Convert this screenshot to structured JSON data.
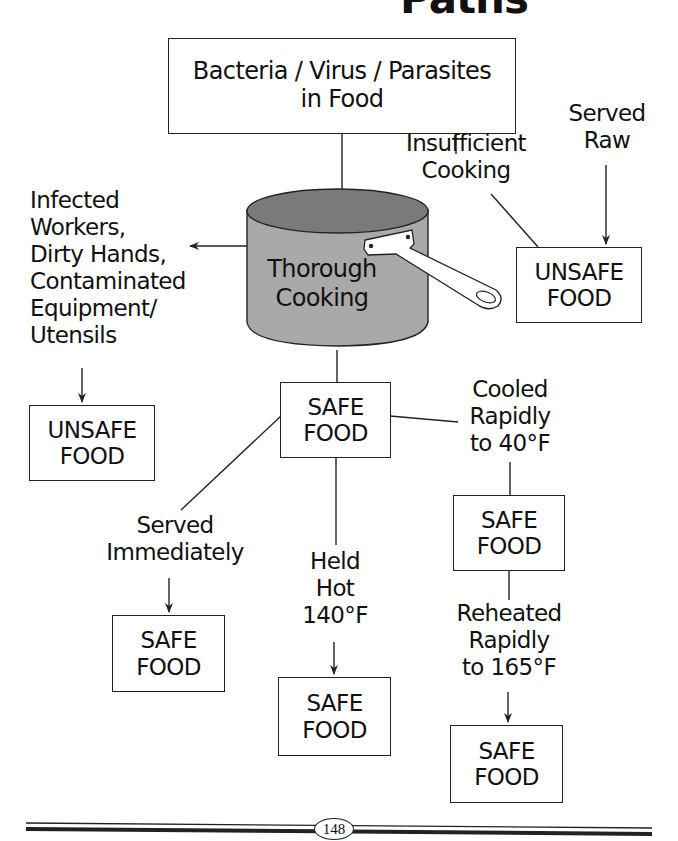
{
  "page": {
    "title_fragment": "Paths",
    "page_number": "148"
  },
  "nodes": {
    "source": {
      "lines": [
        "Bacteria / Virus / Parasites",
        "in Food"
      ]
    },
    "cooking": {
      "lines": [
        "Thorough",
        "Cooking"
      ],
      "icon": "cooking-pot-icon"
    },
    "contamination_cause": {
      "lines": [
        "Infected",
        "Workers,",
        "Dirty Hands,",
        "Contaminated",
        "Equipment/",
        "Utensils"
      ]
    },
    "unsafe_left": {
      "lines": [
        "UNSAFE",
        "FOOD"
      ]
    },
    "insufficient_cooking": {
      "lines": [
        "Insufficient",
        "Cooking"
      ]
    },
    "served_raw": {
      "lines": [
        "Served",
        "Raw"
      ]
    },
    "unsafe_right": {
      "lines": [
        "UNSAFE",
        "FOOD"
      ]
    },
    "safe_center": {
      "lines": [
        "SAFE",
        "FOOD"
      ]
    },
    "cooled_rapidly": {
      "lines": [
        "Cooled",
        "Rapidly",
        "to 40°F"
      ]
    },
    "safe_cooled": {
      "lines": [
        "SAFE",
        "FOOD"
      ]
    },
    "reheated_rapidly": {
      "lines": [
        "Reheated",
        "Rapidly",
        "to 165°F"
      ]
    },
    "safe_reheated": {
      "lines": [
        "SAFE",
        "FOOD"
      ]
    },
    "served_immediately": {
      "lines": [
        "Served",
        "Immediately"
      ]
    },
    "safe_served": {
      "lines": [
        "SAFE",
        "FOOD"
      ]
    },
    "held_hot": {
      "lines": [
        "Held",
        "Hot",
        "140°F"
      ]
    },
    "safe_held": {
      "lines": [
        "SAFE",
        "FOOD"
      ]
    }
  },
  "edges": [
    {
      "from": "source",
      "to": "cooking",
      "arrow": false
    },
    {
      "from": "source",
      "to": "insufficient_cooking",
      "arrow": false
    },
    {
      "from": "insufficient_cooking",
      "to": "unsafe_right",
      "arrow": false
    },
    {
      "from": "served_raw",
      "to": "unsafe_right",
      "arrow": true
    },
    {
      "from": "cooking",
      "to": "contamination_cause",
      "arrow": true
    },
    {
      "from": "contamination_cause",
      "to": "unsafe_left",
      "arrow": true
    },
    {
      "from": "cooking",
      "to": "safe_center",
      "arrow": false
    },
    {
      "from": "safe_center",
      "to": "cooled_rapidly",
      "arrow": false
    },
    {
      "from": "cooled_rapidly",
      "to": "safe_cooled",
      "arrow": false
    },
    {
      "from": "safe_cooled",
      "to": "reheated_rapidly",
      "arrow": false
    },
    {
      "from": "reheated_rapidly",
      "to": "safe_reheated",
      "arrow": true
    },
    {
      "from": "safe_center",
      "to": "served_immediately",
      "arrow": false
    },
    {
      "from": "served_immediately",
      "to": "safe_served",
      "arrow": true
    },
    {
      "from": "safe_center",
      "to": "held_hot",
      "arrow": false
    },
    {
      "from": "held_hot",
      "to": "safe_held",
      "arrow": true
    }
  ],
  "colors": {
    "pot_body": "#a9a9a9",
    "pot_top": "#7a7a7a",
    "line": "#222222",
    "background": "#ffffff"
  }
}
